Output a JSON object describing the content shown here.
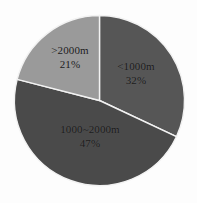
{
  "chart_data": {
    "type": "pie",
    "title": "",
    "subtitle": "",
    "xlabel": "",
    "ylabel": "",
    "legend": "none",
    "grid": false,
    "start_angle_deg": 0,
    "direction": "clockwise",
    "categories": [
      "<1000m",
      "1000~2000m",
      ">2000m"
    ],
    "values": [
      32,
      47,
      21
    ],
    "value_unit": "percent",
    "labels": [
      "32%",
      "47%",
      "21%"
    ],
    "colors": [
      "#565656",
      "#4a4a4a",
      "#9a9a9a"
    ],
    "slices": [
      {
        "name": "<1000m",
        "percent": 32,
        "percent_label": "32%",
        "color": "#565656",
        "start_deg": 0,
        "end_deg": 115.2
      },
      {
        "name": "1000~2000m",
        "percent": 47,
        "percent_label": "47%",
        "color": "#4a4a4a",
        "start_deg": 115.2,
        "end_deg": 284.4
      },
      {
        "name": ">2000m",
        "percent": 21,
        "percent_label": "21%",
        "color": "#9a9a9a",
        "start_deg": 284.4,
        "end_deg": 360
      }
    ]
  },
  "style": {
    "background": "#fdfdfd",
    "separator_color": "#f2f2f2",
    "label_color": "#1a1a1a"
  }
}
